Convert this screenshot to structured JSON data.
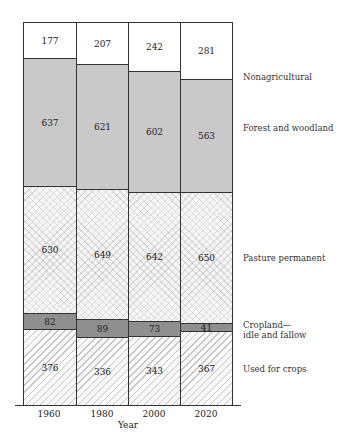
{
  "chart_data": {
    "type": "bar",
    "stacked": true,
    "title": "",
    "xlabel": "Year",
    "ylabel": "",
    "categories": [
      "1960",
      "1980",
      "2000",
      "2020"
    ],
    "series": [
      {
        "name": "Used for crops",
        "values": [
          376,
          336,
          343,
          367
        ],
        "pattern": "diagonal-hatch"
      },
      {
        "name": "Cropland—idle and fallow",
        "values": [
          82,
          89,
          73,
          41
        ],
        "color": "#8f8f8f"
      },
      {
        "name": "Pasture permanent",
        "values": [
          630,
          649,
          642,
          650
        ],
        "pattern": "crosshatch"
      },
      {
        "name": "Forest and woodland",
        "values": [
          637,
          621,
          602,
          563
        ],
        "color": "#c9c9c9"
      },
      {
        "name": "Nonagricultural",
        "values": [
          177,
          207,
          242,
          281
        ],
        "color": "#ffffff"
      }
    ],
    "legend_position": "right",
    "grid": false
  },
  "labels": {
    "legend": {
      "nonag": "Nonagricultural",
      "forest": "Forest and woodland",
      "pasture": "Pasture permanent",
      "idle_line1": "Cropland—",
      "idle_line2": "idle and fallow",
      "crops": "Used for crops"
    },
    "xaxis_title": "Year"
  }
}
